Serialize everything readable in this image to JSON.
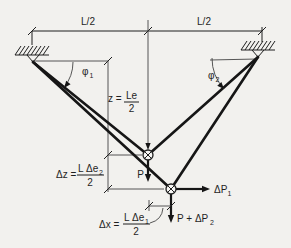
{
  "colors": {
    "background": "#f2f1ee",
    "ink": "#1f1f1f"
  },
  "labels": {
    "span_left": "L/2",
    "span_right": "L/2",
    "angle_left": {
      "base": "φ",
      "sub": "1"
    },
    "angle_right": {
      "base": "φ",
      "sub": "2"
    },
    "sag": {
      "lhs": "z =",
      "numerator": "Le",
      "denominator": "2"
    },
    "delta_z": {
      "lhs": "Δz =",
      "numerator": "L Δe",
      "numerator_sub": "2",
      "denominator": "2"
    },
    "delta_x": {
      "lhs": "Δx =",
      "numerator": "L Δe",
      "numerator_sub": "1",
      "denominator": "2"
    },
    "load": "P",
    "delta_p1": {
      "base": "ΔP",
      "sub": "1"
    },
    "load_plus_delta_p2": {
      "base": "P + ΔP",
      "sub": "2"
    }
  }
}
